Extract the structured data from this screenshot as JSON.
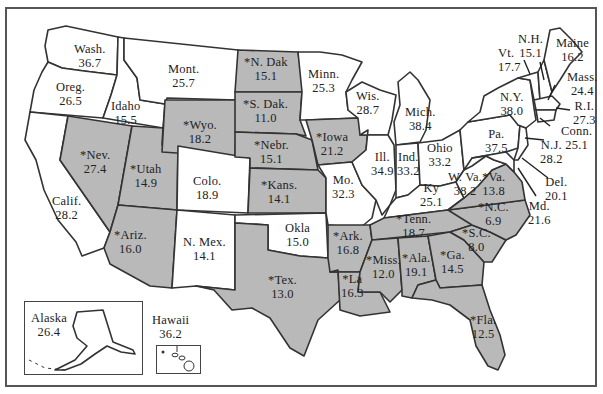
{
  "map": {
    "type": "choropleth-us-states",
    "legend_note": "States marked with * are shaded",
    "colors": {
      "shaded": "#b9b9b9",
      "unshaded": "#ffffff",
      "outline": "#333333",
      "frame": "#555555"
    },
    "states": [
      {
        "id": "wash",
        "label": "Wash.",
        "value": "36.7",
        "starred": false
      },
      {
        "id": "oreg",
        "label": "Oreg.",
        "value": "26.5",
        "starred": false
      },
      {
        "id": "calif",
        "label": "Calif.",
        "value": "28.2",
        "starred": false
      },
      {
        "id": "idaho",
        "label": "Idaho",
        "value": "15.5",
        "starred": false
      },
      {
        "id": "nev",
        "label": "*Nev.",
        "value": "27.4",
        "starred": true
      },
      {
        "id": "mont",
        "label": "Mont.",
        "value": "25.7",
        "starred": false
      },
      {
        "id": "wyo",
        "label": "*Wyo.",
        "value": "18.2",
        "starred": true
      },
      {
        "id": "utah",
        "label": "*Utah",
        "value": "14.9",
        "starred": true
      },
      {
        "id": "ariz",
        "label": "*Ariz.",
        "value": "16.0",
        "starred": true
      },
      {
        "id": "colo",
        "label": "Colo.",
        "value": "18.9",
        "starred": false
      },
      {
        "id": "nmex",
        "label": "N. Mex.",
        "value": "14.1",
        "starred": false
      },
      {
        "id": "ndak",
        "label": "*N. Dak",
        "value": "15.1",
        "starred": true
      },
      {
        "id": "sdak",
        "label": "*S. Dak.",
        "value": "11.0",
        "starred": true
      },
      {
        "id": "nebr",
        "label": "*Nebr.",
        "value": "15.1",
        "starred": true
      },
      {
        "id": "kans",
        "label": "*Kans.",
        "value": "14.1",
        "starred": true
      },
      {
        "id": "okla",
        "label": "Okla",
        "value": "15.0",
        "starred": false
      },
      {
        "id": "tex",
        "label": "*Tex.",
        "value": "13.0",
        "starred": true
      },
      {
        "id": "minn",
        "label": "Minn.",
        "value": "25.3",
        "starred": false
      },
      {
        "id": "iowa",
        "label": "*Iowa",
        "value": "21.2",
        "starred": true
      },
      {
        "id": "mo",
        "label": "Mo.",
        "value": "32.3",
        "starred": false
      },
      {
        "id": "ark",
        "label": "*Ark.",
        "value": "16.8",
        "starred": true
      },
      {
        "id": "la",
        "label": "*La",
        "value": "16.3",
        "starred": true
      },
      {
        "id": "wis",
        "label": "Wis.",
        "value": "28.7",
        "starred": false
      },
      {
        "id": "ill",
        "label": "Ill.",
        "value": "34.9",
        "starred": false
      },
      {
        "id": "mich",
        "label": "Mich.",
        "value": "38.4",
        "starred": false
      },
      {
        "id": "ind",
        "label": "Ind.",
        "value": "33.2",
        "starred": false
      },
      {
        "id": "ohio",
        "label": "Ohio",
        "value": "33.2",
        "starred": false
      },
      {
        "id": "ky",
        "label": "Ky",
        "value": "25.1",
        "starred": false
      },
      {
        "id": "tenn",
        "label": "*Tenn.",
        "value": "18.7",
        "starred": true
      },
      {
        "id": "miss",
        "label": "*Miss.",
        "value": "12.0",
        "starred": true
      },
      {
        "id": "ala",
        "label": "*Ala.",
        "value": "19.1",
        "starred": true
      },
      {
        "id": "ga",
        "label": "*Ga.",
        "value": "14.5",
        "starred": true
      },
      {
        "id": "fla",
        "label": "*Fla.",
        "value": "12.5",
        "starred": true
      },
      {
        "id": "sc",
        "label": "*S.C.",
        "value": "8.0",
        "starred": true
      },
      {
        "id": "nc",
        "label": "*N.C.",
        "value": "6.9",
        "starred": true
      },
      {
        "id": "va",
        "label": "*Va.",
        "value": "13.8",
        "starred": true
      },
      {
        "id": "wva",
        "label": "W. Va.",
        "value": "38.2",
        "starred": false
      },
      {
        "id": "pa",
        "label": "Pa.",
        "value": "37.5",
        "starred": false
      },
      {
        "id": "ny",
        "label": "N.Y.",
        "value": "38.0",
        "starred": false
      },
      {
        "id": "vt",
        "label": "Vt.",
        "value": "17.7",
        "starred": false
      },
      {
        "id": "nh",
        "label": "N.H.",
        "value": "15.1",
        "starred": false
      },
      {
        "id": "maine",
        "label": "Maine",
        "value": "16.2",
        "starred": false
      },
      {
        "id": "mass",
        "label": "Mass.",
        "value": "24.4",
        "starred": false
      },
      {
        "id": "ri",
        "label": "R.I.",
        "value": "27.3",
        "starred": false
      },
      {
        "id": "conn",
        "label": "Conn.",
        "value": "25.1",
        "starred": false
      },
      {
        "id": "nj",
        "label": "N.J.",
        "value": "28.2",
        "starred": false
      },
      {
        "id": "del",
        "label": "Del.",
        "value": "20.1",
        "starred": false
      },
      {
        "id": "md",
        "label": "Md.",
        "value": "21.6",
        "starred": false
      },
      {
        "id": "alaska",
        "label": "Alaska",
        "value": "26.4",
        "starred": false
      },
      {
        "id": "hawaii",
        "label": "Hawaii",
        "value": "36.2",
        "starred": false
      }
    ]
  }
}
